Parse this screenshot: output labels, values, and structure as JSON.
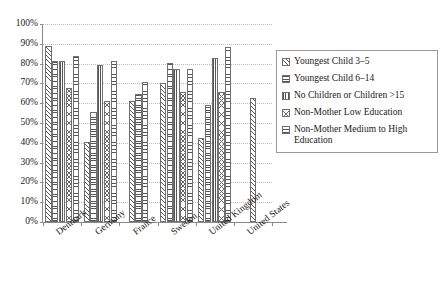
{
  "chart_data": {
    "type": "bar",
    "title": "",
    "xlabel": "",
    "ylabel": "",
    "ylim": [
      0,
      100
    ],
    "ytick_labels": [
      "100%",
      "90%",
      "80%",
      "70%",
      "60%",
      "50%",
      "40%",
      "30%",
      "20%",
      "10%",
      "0%"
    ],
    "ytick_values": [
      100,
      90,
      80,
      70,
      60,
      50,
      40,
      30,
      20,
      10,
      0
    ],
    "grid": "horizontal-dotted",
    "legend_position": "right",
    "categories": [
      "Denmark",
      "Germany",
      "France",
      "Sweden",
      "United Kingdom",
      "United States"
    ],
    "series": [
      {
        "name": "Youngest Child 3–5",
        "pattern": "diagonal-hatch",
        "values": [
          89,
          40.5,
          61,
          70,
          42.5,
          62.5
        ]
      },
      {
        "name": "Youngest Child 6–14",
        "pattern": "horizontal-lines-fine",
        "values": [
          81.5,
          55.5,
          64.5,
          80.5,
          59,
          null
        ]
      },
      {
        "name": "No Children or Children >15",
        "pattern": "vertical-lines",
        "values": [
          81.5,
          79.5,
          null,
          77.5,
          83,
          null
        ]
      },
      {
        "name": "Non-Mother Low Education",
        "pattern": "crosshatch",
        "values": [
          67.5,
          61,
          null,
          65.5,
          65.5,
          null
        ]
      },
      {
        "name": "Non-Mother Medium to High Education",
        "pattern": "horizontal-lines-wide",
        "values": [
          84,
          81.5,
          70.5,
          77.5,
          88.5,
          null
        ]
      }
    ]
  },
  "legend": {
    "items": [
      {
        "label": "Youngest Child 3–5",
        "icon": "swatch-diagonal-hatch-icon"
      },
      {
        "label": "Youngest Child 6–14",
        "icon": "swatch-horizontal-fine-icon"
      },
      {
        "label": "No Children or Children >15",
        "icon": "swatch-vertical-lines-icon"
      },
      {
        "label": "Non-Mother Low Education",
        "icon": "swatch-crosshatch-icon"
      },
      {
        "label": "Non-Mother Medium to High Education",
        "icon": "swatch-horizontal-wide-icon"
      }
    ]
  },
  "colors": {
    "axis": "#8a8a8a",
    "gridline": "#b9b9b9",
    "bar_outline": "#6f6f6f",
    "bar_fill": "#ffffff",
    "text": "#1a1a1a"
  }
}
